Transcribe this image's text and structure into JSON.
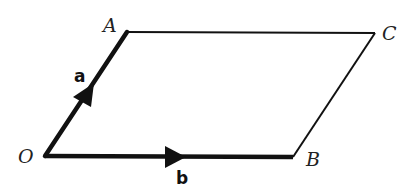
{
  "diagram": {
    "type": "parallelogram-vectors",
    "points": {
      "O": {
        "label": "O",
        "x": 45,
        "y": 156
      },
      "A": {
        "label": "A",
        "x": 127,
        "y": 32
      },
      "C": {
        "label": "C",
        "x": 375,
        "y": 33
      },
      "B": {
        "label": "B",
        "x": 293,
        "y": 157
      }
    },
    "vectors": [
      {
        "name": "a",
        "label": "a",
        "from": "O",
        "to": "A"
      },
      {
        "name": "b",
        "label": "b",
        "from": "O",
        "to": "B"
      }
    ],
    "edges": [
      {
        "from": "O",
        "to": "A",
        "thick": true
      },
      {
        "from": "O",
        "to": "B",
        "thick": true
      },
      {
        "from": "A",
        "to": "C",
        "thick": false
      },
      {
        "from": "C",
        "to": "B",
        "thick": false
      }
    ],
    "colors": {
      "line": "#111111",
      "background": "#ffffff"
    }
  }
}
